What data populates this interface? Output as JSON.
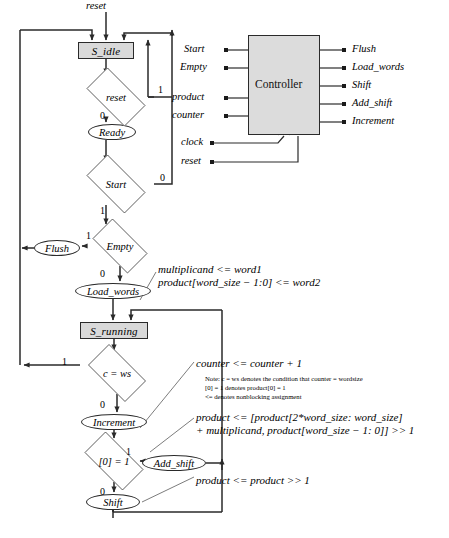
{
  "diagram": {
    "top_signal": "reset",
    "states": [
      {
        "id": "s_idle",
        "label": "S_idle",
        "shape": "rect",
        "x": 78,
        "y": 42,
        "w": 56,
        "h": 17
      },
      {
        "id": "s_running",
        "label": "S_running",
        "shape": "rect",
        "x": 80,
        "y": 322,
        "w": 68,
        "h": 17
      }
    ],
    "outputs": [
      {
        "id": "ready",
        "label": "Ready",
        "x": 88,
        "y": 124,
        "w": 48,
        "h": 16
      },
      {
        "id": "flush",
        "label": "Flush",
        "x": 34,
        "y": 240,
        "w": 46,
        "h": 16
      },
      {
        "id": "load_words",
        "label": "Load_words",
        "x": 75,
        "y": 283,
        "w": 76,
        "h": 16
      },
      {
        "id": "increment",
        "label": "Increment",
        "x": 81,
        "y": 414,
        "w": 66,
        "h": 16
      },
      {
        "id": "add_shift",
        "label": "Add_shift",
        "x": 142,
        "y": 455,
        "w": 64,
        "h": 16
      },
      {
        "id": "shift",
        "label": "Shift",
        "x": 86,
        "y": 494,
        "w": 54,
        "h": 16
      }
    ],
    "decisions": [
      {
        "id": "d_reset",
        "label": "reset",
        "x": 78,
        "y": 76,
        "w": 76,
        "h": 42
      },
      {
        "id": "d_start",
        "label": "Start",
        "x": 78,
        "y": 163,
        "w": 76,
        "h": 42
      },
      {
        "id": "d_empty",
        "label": "Empty",
        "x": 85,
        "y": 226,
        "w": 70,
        "h": 40
      },
      {
        "id": "d_cws",
        "label": "c = ws",
        "x": 80,
        "y": 352,
        "w": 74,
        "h": 42
      },
      {
        "id": "d_bit0",
        "label": "[0] = 1",
        "x": 76,
        "y": 440,
        "w": 76,
        "h": 42
      }
    ],
    "branch_labels": [
      {
        "id": "reset-1",
        "text": "1",
        "x": 158,
        "y": 84
      },
      {
        "id": "reset-0",
        "text": "0",
        "x": 100,
        "y": 110
      },
      {
        "id": "start-0",
        "text": "0",
        "x": 160,
        "y": 172
      },
      {
        "id": "start-1",
        "text": "1",
        "x": 100,
        "y": 205
      },
      {
        "id": "empty-1",
        "text": "1",
        "x": 86,
        "y": 230
      },
      {
        "id": "empty-0",
        "text": "0",
        "x": 100,
        "y": 268
      },
      {
        "id": "cws-1",
        "text": "1",
        "x": 62,
        "y": 356
      },
      {
        "id": "cws-0",
        "text": "0",
        "x": 100,
        "y": 399
      },
      {
        "id": "bit0-1",
        "text": "1",
        "x": 126,
        "y": 446
      },
      {
        "id": "bit0-0",
        "text": "0",
        "x": 100,
        "y": 486
      }
    ],
    "annotations": [
      {
        "id": "load-words-rtl-1",
        "text": "multiplicand <= word1",
        "x": 158,
        "y": 263
      },
      {
        "id": "load-words-rtl-2",
        "text": "product[word_size − 1:0] <= word2",
        "x": 158,
        "y": 276
      },
      {
        "id": "increment-rtl",
        "text": "counter <= counter + 1",
        "x": 196,
        "y": 357
      },
      {
        "id": "add-shift-rtl-1",
        "text": "product <= [product[2*word_size: word_size]",
        "x": 196,
        "y": 411
      },
      {
        "id": "add-shift-rtl-2",
        "text": "+ multiplicand, product[word_size − 1: 0]] >> 1",
        "x": 196,
        "y": 424
      },
      {
        "id": "shift-rtl",
        "text": "product <= product >> 1",
        "x": 196,
        "y": 474
      }
    ],
    "note_lines": [
      "Note: c = ws denotes the condition that counter = wordsize",
      "[0] = 1 denotes product[0] = 1",
      "<= denotes nonblocking assignment"
    ]
  },
  "controller": {
    "label": "Controller",
    "box": {
      "x": 248,
      "y": 35,
      "w": 72,
      "h": 100
    },
    "inputs": [
      {
        "id": "start",
        "label": "Start",
        "y": 50
      },
      {
        "id": "empty",
        "label": "Empty",
        "y": 68
      },
      {
        "id": "product",
        "label": "product",
        "y": 98
      },
      {
        "id": "counter",
        "label": "counter",
        "y": 116
      }
    ],
    "clock_inputs": [
      {
        "id": "clock",
        "label": "clock",
        "y": 143
      },
      {
        "id": "reset",
        "label": "reset",
        "y": 162
      }
    ],
    "outputs": [
      {
        "id": "flush",
        "label": "Flush",
        "y": 50
      },
      {
        "id": "load_words",
        "label": "Load_words",
        "y": 68
      },
      {
        "id": "shift",
        "label": "Shift",
        "y": 86
      },
      {
        "id": "add_shift",
        "label": "Add_shift",
        "y": 104
      },
      {
        "id": "increment",
        "label": "Increment",
        "y": 122
      }
    ]
  }
}
